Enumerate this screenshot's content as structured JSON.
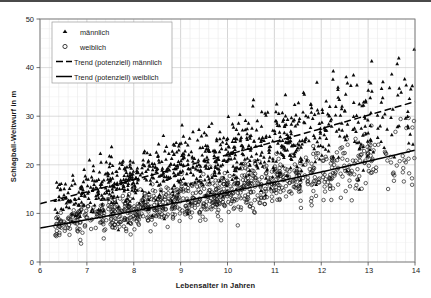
{
  "chart_data": {
    "type": "scatter",
    "title": "",
    "xlabel": "Lebensalter in Jahren",
    "ylabel": "Schlagball-Weitwurf in m",
    "xlim": [
      6,
      14
    ],
    "ylim": [
      0,
      50
    ],
    "xticks": [
      "6",
      "7",
      "8",
      "9",
      "10",
      "11",
      "12",
      "13",
      "14"
    ],
    "yticks": [
      "0",
      "10",
      "20",
      "30",
      "40",
      "50"
    ],
    "grid": "minor vertical and horizontal gridlines, light gray",
    "legend_position": "top-left inside plot area",
    "series": [
      {
        "name": "männlich",
        "marker": "filled-triangle",
        "color": "#000000",
        "n_points": 900,
        "description": "Jungen: Schlagball-Weitwurf steigt von ca. 12 m mit 6 Jahren auf ca. 33 m mit 14 Jahren",
        "x_range": [
          6.3,
          14.0
        ],
        "y_range": [
          3,
          47
        ],
        "trend_at_age_6": 12.0,
        "trend_at_age_14": 33.0
      },
      {
        "name": "weiblich",
        "marker": "open-circle",
        "color": "#000000",
        "n_points": 900,
        "description": "Mädchen: Schlagball-Weitwurf steigt von ca. 7 m mit 6 Jahren auf ca. 23 m mit 14 Jahren",
        "x_range": [
          6.3,
          14.0
        ],
        "y_range": [
          2,
          34
        ],
        "trend_at_age_6": 7.0,
        "trend_at_age_14": 23.0
      },
      {
        "name": "Trend (potenziell) männlich",
        "marker": "dashed-line",
        "color": "#000000",
        "type": "power-trendline",
        "points": [
          [
            6,
            12.0
          ],
          [
            7,
            15.2
          ],
          [
            8,
            18.0
          ],
          [
            9,
            20.6
          ],
          [
            10,
            23.1
          ],
          [
            11,
            25.5
          ],
          [
            12,
            27.8
          ],
          [
            13,
            30.4
          ],
          [
            14,
            33.0
          ]
        ]
      },
      {
        "name": "Trend (potenziell) weiblich",
        "marker": "solid-line",
        "color": "#000000",
        "type": "power-trendline",
        "points": [
          [
            6,
            7.0
          ],
          [
            7,
            9.4
          ],
          [
            8,
            11.6
          ],
          [
            9,
            13.6
          ],
          [
            10,
            15.5
          ],
          [
            11,
            17.4
          ],
          [
            12,
            19.3
          ],
          [
            13,
            21.2
          ],
          [
            14,
            23.0
          ]
        ]
      }
    ]
  },
  "legend": {
    "items": [
      {
        "label": "männlich",
        "marker": "filled-triangle"
      },
      {
        "label": "weiblich",
        "marker": "open-circle"
      },
      {
        "label": "Trend (potenziell) männlich",
        "marker": "dashed-line"
      },
      {
        "label": "Trend (potenziell) weiblich",
        "marker": "solid-line"
      }
    ]
  }
}
